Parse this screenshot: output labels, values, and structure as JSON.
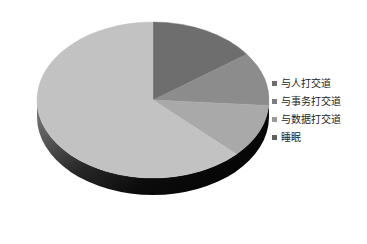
{
  "chart_data": {
    "type": "pie",
    "title": "",
    "subtitle": "",
    "xlabel": "",
    "ylabel": "",
    "three_d": true,
    "grid": false,
    "legend_position": "right",
    "start_angle_deg": 0,
    "direction": "clockwise",
    "categories": [
      "与人打交道",
      "与事务打交道",
      "与数据打交道",
      "睡眠"
    ],
    "values": [
      15,
      11,
      11,
      63
    ],
    "value_unit": "%",
    "colors": [
      "#6e6e6e",
      "#8c8c8c",
      "#a9a9a9",
      "#c2c2c2"
    ],
    "slices": [
      {
        "label": "与人打交道",
        "value": 15,
        "color": "#6e6e6e",
        "start_deg": 0,
        "end_deg": 54
      },
      {
        "label": "与事务打交道",
        "value": 11,
        "color": "#8c8c8c",
        "start_deg": 54,
        "end_deg": 94
      },
      {
        "label": "与数据打交道",
        "value": 11,
        "color": "#a9a9a9",
        "start_deg": 94,
        "end_deg": 134
      },
      {
        "label": "睡眠",
        "value": 63,
        "color": "#c2c2c2",
        "start_deg": 134,
        "end_deg": 360
      }
    ]
  },
  "chart": {
    "background_color": "#ffffff",
    "depth_color_top": "#5a5a5a",
    "depth_color_bottom": "#0a0a0a",
    "center_x": 153,
    "center_y": 100,
    "radius_x": 116,
    "radius_y": 78,
    "depth": 17
  },
  "legend": {
    "marker_icon": "square-marker-icon",
    "items": [
      {
        "label": "与人打交道",
        "color": "#6e6e6e"
      },
      {
        "label": "与事务打交道",
        "color": "#7d7d7d"
      },
      {
        "label": "与数据打交道",
        "color": "#9a9a9a"
      },
      {
        "label": "睡眠",
        "color": "#5f5f5f"
      }
    ]
  }
}
